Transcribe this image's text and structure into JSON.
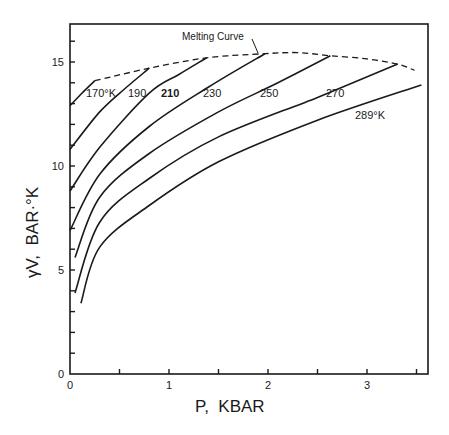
{
  "chart_data": {
    "type": "line",
    "title": "",
    "xlabel": "P, KBAR",
    "ylabel": "γV, BAR·°K",
    "xlim": [
      0,
      3.6
    ],
    "ylim": [
      0,
      16.8
    ],
    "xticks": [
      0,
      1,
      2,
      3
    ],
    "xminor": [
      0.5,
      1.5,
      2.5,
      3.5
    ],
    "yticks": [
      0,
      5,
      10,
      15
    ],
    "yminor": [
      1,
      2,
      3,
      4,
      6,
      7,
      8,
      9,
      11,
      12,
      13,
      14,
      16
    ],
    "grid": false,
    "legend": "inline labels",
    "series": [
      {
        "name": "170°K",
        "label": "170°K",
        "points": [
          [
            0,
            12.9
          ],
          [
            0.12,
            13.5
          ],
          [
            0.25,
            14.1
          ]
        ]
      },
      {
        "name": "190",
        "label": "190",
        "points": [
          [
            0,
            10.8
          ],
          [
            0.3,
            12.6
          ],
          [
            0.55,
            13.7
          ],
          [
            0.8,
            14.7
          ]
        ]
      },
      {
        "name": "210",
        "label": "210",
        "points": [
          [
            0,
            8.8
          ],
          [
            0.3,
            10.9
          ],
          [
            0.8,
            13.5
          ],
          [
            1.1,
            14.4
          ],
          [
            1.38,
            15.2
          ]
        ]
      },
      {
        "name": "230",
        "label": "230",
        "points": [
          [
            0,
            6.9
          ],
          [
            0.3,
            9.6
          ],
          [
            0.8,
            11.9
          ],
          [
            1.4,
            13.8
          ],
          [
            1.97,
            15.4
          ]
        ]
      },
      {
        "name": "250",
        "label": "250",
        "points": [
          [
            0.05,
            5.6
          ],
          [
            0.3,
            8.5
          ],
          [
            0.8,
            10.6
          ],
          [
            1.5,
            12.6
          ],
          [
            2.1,
            14.0
          ],
          [
            2.63,
            15.3
          ]
        ]
      },
      {
        "name": "270",
        "label": "270",
        "points": [
          [
            0.05,
            3.9
          ],
          [
            0.3,
            7.3
          ],
          [
            0.8,
            9.4
          ],
          [
            1.5,
            11.4
          ],
          [
            2.5,
            13.3
          ],
          [
            3.31,
            14.9
          ]
        ]
      },
      {
        "name": "289°K",
        "label": "289°K",
        "points": [
          [
            0.11,
            3.4
          ],
          [
            0.3,
            6.1
          ],
          [
            0.8,
            8.1
          ],
          [
            1.5,
            10.2
          ],
          [
            2.5,
            12.2
          ],
          [
            3.55,
            13.9
          ]
        ]
      }
    ],
    "melting_curve": {
      "name": "Melting Curve",
      "style": "dashed",
      "points": [
        [
          0.25,
          14.1
        ],
        [
          0.8,
          14.7
        ],
        [
          1.38,
          15.2
        ],
        [
          1.97,
          15.4
        ],
        [
          2.3,
          15.45
        ],
        [
          2.63,
          15.3
        ],
        [
          3.0,
          15.15
        ],
        [
          3.31,
          14.9
        ],
        [
          3.48,
          14.6
        ]
      ]
    },
    "annotations": [
      {
        "text": "Melting Curve",
        "position": [
          1.15,
          16.2
        ]
      },
      {
        "text": "170°K",
        "position": [
          0.28,
          13.1
        ]
      },
      {
        "text": "190",
        "position": [
          0.6,
          13.1
        ]
      },
      {
        "text": "210",
        "position": [
          0.9,
          13.1
        ]
      },
      {
        "text": "230",
        "position": [
          1.3,
          13.1
        ]
      },
      {
        "text": "250",
        "position": [
          1.93,
          13.1
        ]
      },
      {
        "text": "270",
        "position": [
          2.6,
          13.1
        ]
      },
      {
        "text": "289°K",
        "position": [
          3.05,
          12.3
        ]
      }
    ]
  },
  "axes": {
    "x_title": "P,  KBAR",
    "y_title": "γV,  BAR·°K",
    "x_tick_labels": [
      "0",
      "1",
      "2",
      "3"
    ],
    "y_tick_labels": [
      "0",
      "5",
      "10",
      "15"
    ]
  },
  "labels": {
    "melting": "Melting Curve",
    "t170": "170°K",
    "t190": "190",
    "t210": "210",
    "t230": "230",
    "t250": "250",
    "t270": "270",
    "t289": "289°K"
  }
}
